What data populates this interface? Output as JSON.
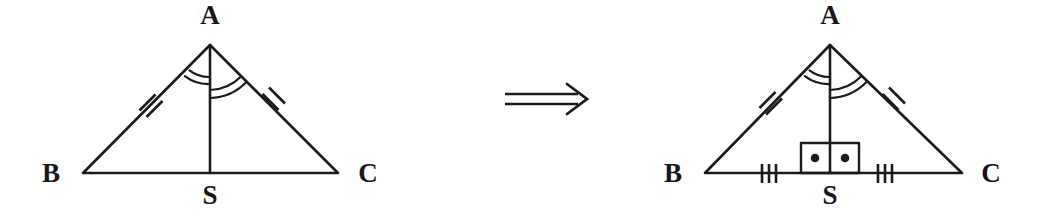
{
  "figure": {
    "ink_color": "#1b1b1f",
    "background_color": "#ffffff",
    "relation_symbol": "=>",
    "relation_name": "implies-double-arrow"
  },
  "left_triangle": {
    "name": "triangle-ABS-C-given",
    "vertex_labels": {
      "apex": "A",
      "left": "B",
      "right": "C",
      "foot": "S"
    },
    "geometry": {
      "apex": [
        210,
        45
      ],
      "left": [
        83,
        173
      ],
      "right": [
        338,
        173
      ],
      "foot": [
        210,
        173
      ]
    },
    "label_positions": {
      "apex": [
        210,
        24
      ],
      "left": [
        51,
        182
      ],
      "right": [
        368,
        182
      ],
      "foot": [
        210,
        204
      ]
    },
    "markings": {
      "side_ticks": {
        "count": 2,
        "on_sides": [
          "AB",
          "AC"
        ],
        "meaning": "AB equals AC"
      },
      "angle_arcs": {
        "left_arc_count": 2,
        "right_arc_count": 2,
        "at_vertex": "A",
        "meaning": "AS bisects angle BAC"
      },
      "base_ticks": {
        "count": 0,
        "on_sides": []
      },
      "right_angle_box": false,
      "right_angle_dots": 0
    }
  },
  "right_triangle": {
    "name": "triangle-ABS-C-conclusion",
    "vertex_labels": {
      "apex": "A",
      "left": "B",
      "right": "C",
      "foot": "S"
    },
    "geometry": {
      "apex": [
        830,
        45
      ],
      "left": [
        705,
        173
      ],
      "right": [
        962,
        173
      ],
      "foot": [
        830,
        173
      ]
    },
    "label_positions": {
      "apex": [
        830,
        24
      ],
      "left": [
        673,
        182
      ],
      "right": [
        991,
        182
      ],
      "foot": [
        830,
        204
      ]
    },
    "markings": {
      "side_ticks": {
        "count": 2,
        "on_sides": [
          "AB",
          "AC"
        ],
        "meaning": "AB equals AC"
      },
      "angle_arcs": {
        "left_arc_count": 2,
        "right_arc_count": 2,
        "at_vertex": "A",
        "meaning": "AS bisects angle BAC"
      },
      "base_ticks": {
        "count": 3,
        "on_sides": [
          "BS",
          "SC"
        ],
        "meaning": "BS equals SC"
      },
      "right_angle_box": true,
      "right_angle_dots": 2,
      "right_angle_meaning": "AS perpendicular to BC"
    }
  },
  "arrow": {
    "x_start": 505,
    "x_end": 586,
    "y_center": 99,
    "glyph": "⟹"
  }
}
